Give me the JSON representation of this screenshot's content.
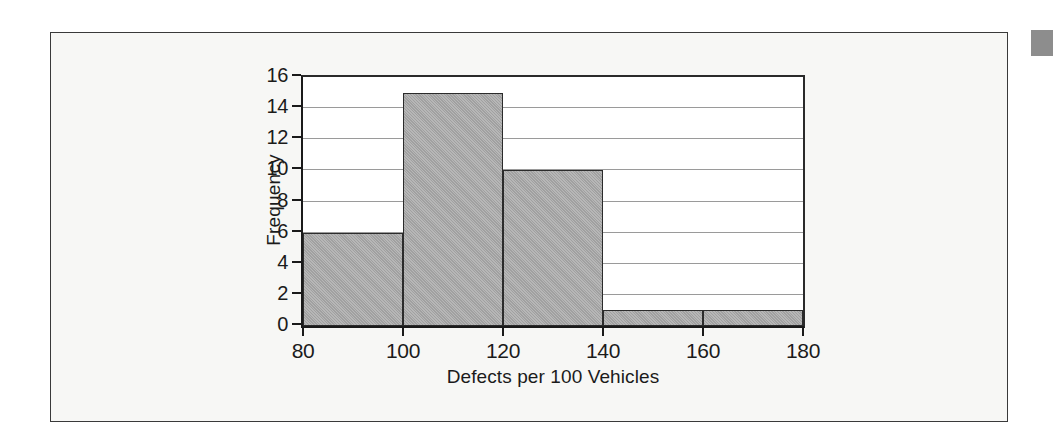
{
  "figure": {
    "background_color": "#ffffff",
    "card_color": "#f7f7f5",
    "card_border_color": "#3a3a3a",
    "corner_marker_color": "#8d8d8d"
  },
  "chart_data": {
    "type": "bar",
    "subtype": "histogram",
    "title": "",
    "xlabel": "Defects per 100 Vehicles",
    "ylabel": "Frequency",
    "xlim": [
      80,
      180
    ],
    "ylim": [
      0,
      16
    ],
    "xticks": [
      80,
      100,
      120,
      140,
      160,
      180
    ],
    "xtick_labels": [
      "80",
      "100",
      "120",
      "140",
      "160",
      "180"
    ],
    "yticks": [
      0,
      2,
      4,
      6,
      8,
      10,
      12,
      14,
      16
    ],
    "ytick_labels": [
      "0",
      "2",
      "4",
      "6",
      "8",
      "10",
      "12",
      "14",
      "16"
    ],
    "grid": "horizontal",
    "gridline_color": "#9a9a9a",
    "legend": "none",
    "bar_fill_color": "#a9a9a9",
    "bar_edge_color": "#2b2b2b",
    "plot_background": "#ffffff",
    "bin_edges": [
      80,
      100,
      120,
      140,
      160,
      180
    ],
    "bin_width": 20,
    "categories": [
      "80-100",
      "100-120",
      "120-140",
      "140-160",
      "160-180"
    ],
    "values": [
      6,
      15,
      10,
      1,
      1
    ],
    "bins": [
      {
        "label": "80-100",
        "start": 80,
        "end": 100,
        "frequency": 6
      },
      {
        "label": "100-120",
        "start": 100,
        "end": 120,
        "frequency": 15
      },
      {
        "label": "120-140",
        "start": 120,
        "end": 140,
        "frequency": 10
      },
      {
        "label": "140-160",
        "start": 140,
        "end": 160,
        "frequency": 1
      },
      {
        "label": "160-180",
        "start": 160,
        "end": 180,
        "frequency": 1
      }
    ],
    "total_frequency": 33
  }
}
